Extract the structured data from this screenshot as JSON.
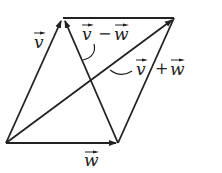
{
  "diagram": {
    "vertices": {
      "origin": [
        6,
        143
      ],
      "w_tip": [
        118,
        143
      ],
      "v_tip": [
        63,
        18
      ],
      "sum_tip": [
        174,
        18
      ]
    },
    "vectors": [
      {
        "name": "v",
        "label": "v",
        "from": "origin",
        "to": "v_tip"
      },
      {
        "name": "w",
        "label": "w",
        "from": "origin",
        "to": "w_tip"
      },
      {
        "name": "v_plus_w",
        "label": "v + w",
        "from": "origin",
        "to": "sum_tip"
      },
      {
        "name": "v_minus_w",
        "label": "v − w",
        "from": "w_tip",
        "to": "v_tip"
      }
    ],
    "labels": {
      "v": "v",
      "w": "w",
      "v_minus_w_v": "v",
      "v_minus_w_op": "−",
      "v_minus_w_w": "w",
      "v_plus_w_v": "v",
      "v_plus_w_op": "+",
      "v_plus_w_w": "w"
    },
    "line_color": "#222222"
  }
}
